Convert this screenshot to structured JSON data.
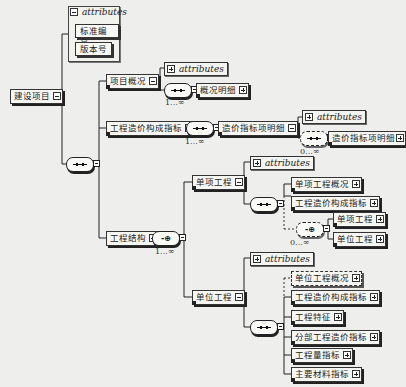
{
  "diagram": {
    "type": "xml-schema-tree",
    "root": {
      "label": "建设项目",
      "attributes": {
        "title": "attributes",
        "items": [
          "标准编号",
          "版本号"
        ]
      }
    },
    "root_sequence": {
      "kind": "sequence"
    },
    "children": [
      {
        "label": "项目概况",
        "attributes_title": "attributes",
        "sequence": {
          "kind": "sequence",
          "cardinality": "1...∞"
        },
        "children": [
          {
            "label": "概况明细"
          }
        ]
      },
      {
        "label": "工程造价构成指标",
        "sequence": {
          "kind": "sequence",
          "cardinality": "1...∞"
        },
        "child": {
          "label": "造价指标项明细",
          "attributes_title": "attributes",
          "sequence": {
            "kind": "sequence",
            "cardinality": "0...∞",
            "optional": true
          },
          "children": [
            {
              "label": "造价指标项明细"
            }
          ]
        }
      },
      {
        "label": "工程结构",
        "choice": {
          "kind": "choice",
          "cardinality": "1...∞"
        },
        "children": [
          {
            "label": "单项工程",
            "attributes_title": "attributes",
            "sequence": {
              "kind": "sequence"
            },
            "children": [
              {
                "label": "单项工程概况"
              },
              {
                "label": "工程造价构成指标"
              }
            ],
            "choice": {
              "kind": "choice",
              "cardinality": "0...∞",
              "optional": true,
              "children": [
                {
                  "label": "单项工程"
                },
                {
                  "label": "单位工程"
                }
              ]
            }
          },
          {
            "label": "单位工程",
            "attributes_title": "attributes",
            "sequence": {
              "kind": "sequence"
            },
            "children": [
              {
                "label": "单位工程概况",
                "optional": true
              },
              {
                "label": "工程造价构成指标"
              },
              {
                "label": "工程特征"
              },
              {
                "label": "分部工程造价指标"
              },
              {
                "label": "工程量指标"
              },
              {
                "label": "主要材料指标"
              }
            ]
          }
        ]
      }
    ]
  },
  "colors": {
    "background": "#eeeeec",
    "line": "#222222",
    "box_fill": "#f6f6f2"
  }
}
